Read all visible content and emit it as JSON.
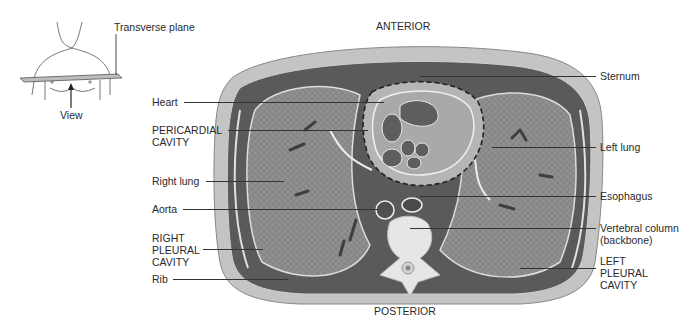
{
  "orientation": {
    "anterior": "ANTERIOR",
    "posterior": "POSTERIOR"
  },
  "inset": {
    "plane_label": "Transverse plane",
    "view_label": "View"
  },
  "labels_left": [
    {
      "id": "heart",
      "text": "Heart"
    },
    {
      "id": "pericardial-cavity",
      "text": "PERICARDIAL\nCAVITY"
    },
    {
      "id": "right-lung",
      "text": "Right lung"
    },
    {
      "id": "aorta",
      "text": "Aorta"
    },
    {
      "id": "right-pleural-cavity",
      "text": "RIGHT\nPLEURAL\nCAVITY"
    },
    {
      "id": "rib",
      "text": "Rib"
    }
  ],
  "labels_right": [
    {
      "id": "sternum",
      "text": "Sternum"
    },
    {
      "id": "left-lung",
      "text": "Left lung"
    },
    {
      "id": "esophagus",
      "text": "Esophagus"
    },
    {
      "id": "vertebral-column",
      "text": "Vertebral column\n(backbone)"
    },
    {
      "id": "left-pleural-cavity",
      "text": "LEFT\nPLEURAL\nCAVITY"
    }
  ],
  "colors": {
    "skin": "#bdbdbd",
    "muscle": "#555555",
    "lung": "#8e8e8e",
    "heart": "#a8a8a8",
    "chamber": "#6a6a6a",
    "bone": "#e4e4e4",
    "line": "#333333"
  }
}
